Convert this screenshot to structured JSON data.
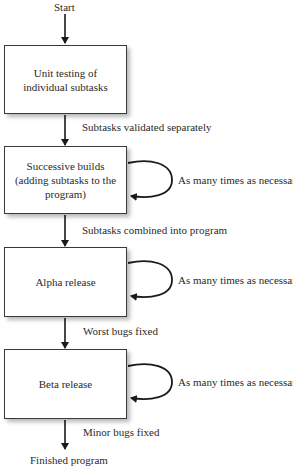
{
  "diagram": {
    "start_label": "Start",
    "end_label": "Finished program",
    "steps": [
      {
        "label": "Unit testing of individual subtasks",
        "loop": false
      },
      {
        "label": "Successive builds (adding subtasks to the program)",
        "loop": true
      },
      {
        "label": "Alpha release",
        "loop": true
      },
      {
        "label": "Beta release",
        "loop": true
      }
    ],
    "transitions": [
      "Subtasks validated separately",
      "Subtasks combined into program",
      "Worst bugs fixed",
      "Minor bugs fixed"
    ],
    "loop_label": "As many times as necessary"
  }
}
